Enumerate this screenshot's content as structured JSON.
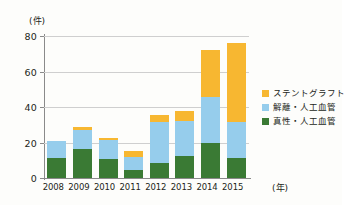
{
  "chart_data": {
    "type": "bar",
    "stacked": true,
    "title": "",
    "subtitle": "",
    "xlabel": "(年)",
    "ylabel": "(件)",
    "categories": [
      "2008",
      "2009",
      "2010",
      "2011",
      "2012",
      "2013",
      "2014",
      "2015"
    ],
    "series": [
      {
        "name": "真性・人工血管",
        "color": "#3a7a34",
        "values": [
          11.5,
          16.5,
          10.5,
          4.5,
          8.5,
          12.5,
          19.5,
          11.5
        ]
      },
      {
        "name": "解離・人工血管",
        "color": "#96cdec",
        "values": [
          9.5,
          10.5,
          11.0,
          7.5,
          23.0,
          19.5,
          26.0,
          20.0
        ]
      },
      {
        "name": "ステントグラフト",
        "color": "#f7b731",
        "values": [
          0,
          2.0,
          1.0,
          3.0,
          4.0,
          5.5,
          26.5,
          44.5
        ]
      }
    ],
    "totals": [
      21,
      29,
      22.5,
      15,
      35.5,
      37.5,
      72,
      76
    ],
    "ylim": [
      0,
      80
    ],
    "yticks": [
      0,
      20,
      40,
      60,
      80
    ],
    "ytick_labels": [
      "0",
      "20",
      "40",
      "60",
      "80"
    ],
    "grid": true,
    "grid_axis": "y",
    "legend_position": "right"
  },
  "legend": {
    "items": [
      {
        "label": "ステントグラフト",
        "color": "#f7b731"
      },
      {
        "label": "解離・人工血管",
        "color": "#96cdec"
      },
      {
        "label": "真性・人工血管",
        "color": "#3a7a34"
      }
    ]
  },
  "axes": {
    "y_unit": "(件)",
    "x_unit": "(年)"
  }
}
